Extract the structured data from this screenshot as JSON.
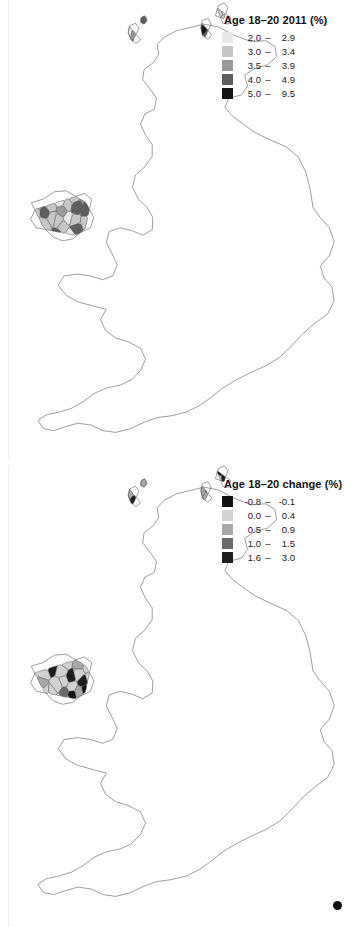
{
  "figure": {
    "type": "cartogram-pair",
    "background_color": "#ffffff",
    "region": "United Kingdom",
    "panel_count": 2
  },
  "panels": [
    {
      "id": "age-18-20-2011",
      "legend": {
        "title": "Age 18–20 2011 (%)",
        "classes": [
          {
            "color": "#e8e8e8",
            "low": "2.0",
            "dash": "–",
            "high": "2.9"
          },
          {
            "color": "#c6c6c6",
            "low": "3.0",
            "dash": "–",
            "high": "3.4"
          },
          {
            "color": "#9a9a9a",
            "low": "3.5",
            "dash": "–",
            "high": "3.9"
          },
          {
            "color": "#5e5e5e",
            "low": "4.0",
            "dash": "–",
            "high": "4.9"
          },
          {
            "color": "#161616",
            "low": "5.0",
            "dash": "–",
            "high": "9.5"
          }
        ]
      },
      "map": {
        "stroke": "#4a4a4a",
        "stroke_width": 0.45,
        "class_mix": [
          0.2,
          0.26,
          0.22,
          0.14,
          0.18
        ],
        "seed": 20111
      }
    },
    {
      "id": "age-18-20-change",
      "legend": {
        "title": "Age 18–20 change (%)",
        "classes": [
          {
            "color": "#111111",
            "low": "-0.8",
            "dash": "–",
            "high": "-0.1"
          },
          {
            "color": "#d2d2d2",
            "low": "0.0",
            "dash": "–",
            "high": "0.4"
          },
          {
            "color": "#a8a8a8",
            "low": "0.5",
            "dash": "–",
            "high": "0.9"
          },
          {
            "color": "#6b6b6b",
            "low": "1.0",
            "dash": "–",
            "high": "1.5"
          },
          {
            "color": "#1d1d1d",
            "low": "1.6",
            "dash": "–",
            "high": "3.0"
          }
        ]
      },
      "map": {
        "stroke": "#4a4a4a",
        "stroke_width": 0.45,
        "class_mix": [
          0.1,
          0.4,
          0.24,
          0.1,
          0.16
        ],
        "seed": 77313
      }
    }
  ],
  "annotations": {
    "corner_marker": "●"
  }
}
